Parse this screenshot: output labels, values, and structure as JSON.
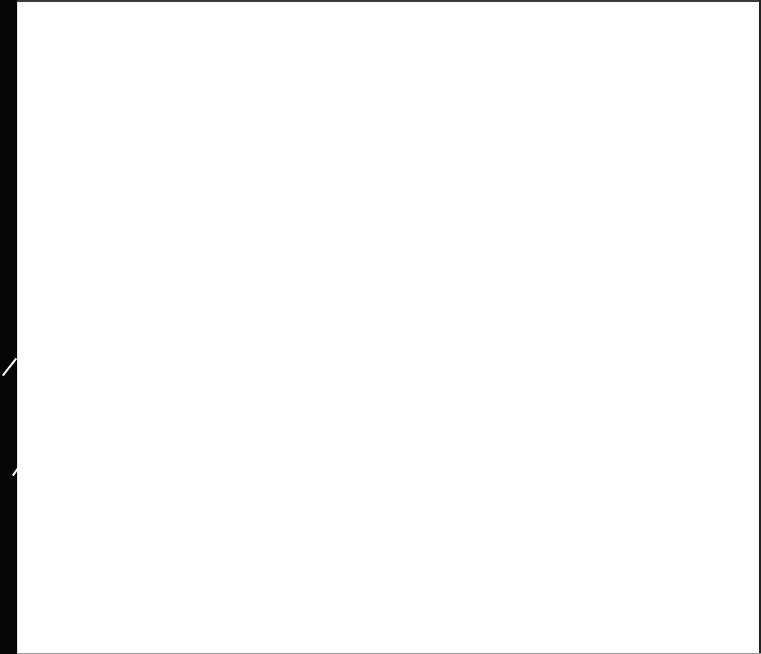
{
  "page": {
    "background": "#ffffff",
    "edge_color": "#000000",
    "faint_header_text": ""
  }
}
